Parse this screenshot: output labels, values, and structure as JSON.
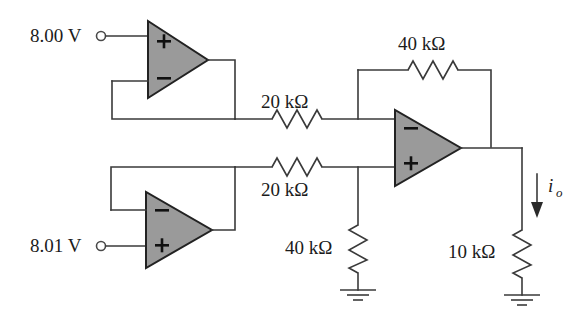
{
  "figure": {
    "name": "instrumentation-amplifier-circuit",
    "background_color": "#ffffff",
    "wire_color": "#3a3a3a",
    "opamp_fill_color": "#9a9a9a",
    "opamp_stroke_color": "#222222"
  },
  "sources": [
    {
      "id": "v1",
      "label": "8.00 V",
      "terminal": "input-terminal-circle"
    },
    {
      "id": "v2",
      "label": "8.01 V",
      "terminal": "input-terminal-circle"
    }
  ],
  "opamps": [
    {
      "id": "opamp-top-left",
      "top_sign": "+",
      "bottom_sign": "−"
    },
    {
      "id": "opamp-bottom-left",
      "top_sign": "−",
      "bottom_sign": "+"
    },
    {
      "id": "opamp-right",
      "top_sign": "−",
      "bottom_sign": "+"
    }
  ],
  "resistors": [
    {
      "id": "r-feedback-40k",
      "label": "40 kΩ",
      "orientation": "horizontal"
    },
    {
      "id": "r-input-top-20k",
      "label": "20 kΩ",
      "orientation": "horizontal"
    },
    {
      "id": "r-input-bottom-20k",
      "label": "20 kΩ",
      "orientation": "horizontal"
    },
    {
      "id": "r-shunt-40k",
      "label": "40 kΩ",
      "orientation": "vertical"
    },
    {
      "id": "r-load-10k",
      "label": "10 kΩ",
      "orientation": "vertical"
    }
  ],
  "current": {
    "id": "output-current",
    "symbol": "i",
    "subscript": "o",
    "direction": "down"
  },
  "grounds": [
    {
      "id": "ground-shunt"
    },
    {
      "id": "ground-load"
    }
  ]
}
